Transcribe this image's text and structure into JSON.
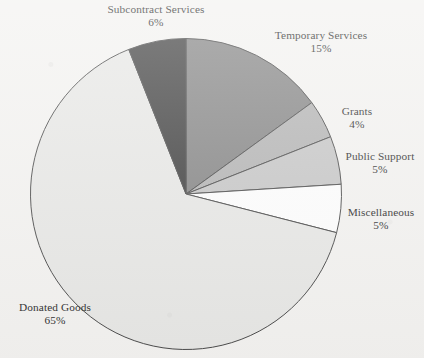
{
  "chart_data": {
    "type": "pie",
    "title": "",
    "subtitle": "",
    "xlabel": "",
    "ylabel": "",
    "legend_position": "none",
    "grid": false,
    "units": "percent",
    "label_format": "name + percent",
    "start_angle_deg": 0,
    "direction": "clockwise",
    "total": 100,
    "categories": [
      "Temporary Services",
      "Grants",
      "Public Support",
      "Miscellaneous",
      "Donated Goods",
      "Subcontract Services"
    ],
    "values": [
      15,
      4,
      5,
      5,
      65,
      6
    ],
    "slices": [
      {
        "label": "Temporary Services",
        "percent_text": "15%",
        "value": 15,
        "color": "#858585",
        "start_deg": 0,
        "end_deg": 54
      },
      {
        "label": "Grants",
        "percent_text": "4%",
        "value": 4,
        "color": "#b3b3b3",
        "start_deg": 54,
        "end_deg": 68.4
      },
      {
        "label": "Public Support",
        "percent_text": "5%",
        "value": 5,
        "color": "#c6c6c6",
        "start_deg": 68.4,
        "end_deg": 86.4
      },
      {
        "label": "Miscellaneous",
        "percent_text": "5%",
        "value": 5,
        "color": "#fdfdfd",
        "start_deg": 86.4,
        "end_deg": 104.4
      },
      {
        "label": "Donated Goods",
        "percent_text": "65%",
        "value": 65,
        "color": "#e7e7e5",
        "start_deg": 104.4,
        "end_deg": 338.4
      },
      {
        "label": "Subcontract Services",
        "percent_text": "6%",
        "value": 6,
        "color": "#3f3f3f",
        "start_deg": 338.4,
        "end_deg": 360
      }
    ],
    "stroke_color": "#4a4a4a",
    "background_color": "#f3f2f0"
  },
  "labels": {
    "subcontract_services": {
      "name": "Subcontract Services",
      "percent": "6%"
    },
    "temporary_services": {
      "name": "Temporary Services",
      "percent": "15%"
    },
    "grants": {
      "name": "Grants",
      "percent": "4%"
    },
    "public_support": {
      "name": "Public Support",
      "percent": "5%"
    },
    "miscellaneous": {
      "name": "Miscellaneous",
      "percent": "5%"
    },
    "donated_goods": {
      "name": "Donated Goods",
      "percent": "65%"
    }
  }
}
